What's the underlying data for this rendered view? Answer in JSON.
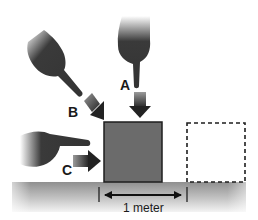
{
  "diagram": {
    "forces": [
      {
        "label": "A",
        "direction": "down"
      },
      {
        "label": "B",
        "direction": "diagonal down-right"
      },
      {
        "label": "C",
        "direction": "right"
      }
    ],
    "distance_label": "1 meter",
    "colors": {
      "box_fill": "#6b6b6b",
      "box_stroke": "#1e1e1e",
      "hand": "#3a3a3a",
      "arrow_dark": "#2a2a2a",
      "ground_dark": "#9a9a9a",
      "ground_light": "#e8e8e8",
      "dashed_outline": "#1e1e1e"
    }
  }
}
